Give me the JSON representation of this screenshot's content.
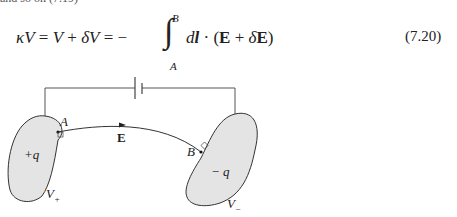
{
  "document": {
    "cutoff_line": "and so on (7.19)",
    "equation": {
      "lhs_kappa": "κ",
      "lhs_V": "V",
      "eq1": " = ",
      "V": "V",
      "plus1": " + ",
      "deltaV_delta": "δ",
      "deltaV_V": "V",
      "eq2": " = −",
      "integral": "∫",
      "upper_limit": "B",
      "lower_limit": "A",
      "d": "d",
      "l": "l",
      "dot": " · (",
      "E1": "E",
      "plus2": " + ",
      "delta": "δ",
      "E2": "E",
      "close": ")",
      "number": "(7.20)"
    },
    "diagram": {
      "labels": {
        "point_a": "A",
        "point_b": "B",
        "field": "E",
        "charge_plus": "+q",
        "charge_minus": "− q",
        "potential_plus_V": "V",
        "potential_plus_sub": "+",
        "potential_minus_V": "V",
        "potential_minus_sub": "−"
      },
      "colors": {
        "conductor_fill": "#e4e4e4",
        "stroke": "#333333",
        "wire": "#555555"
      }
    }
  }
}
